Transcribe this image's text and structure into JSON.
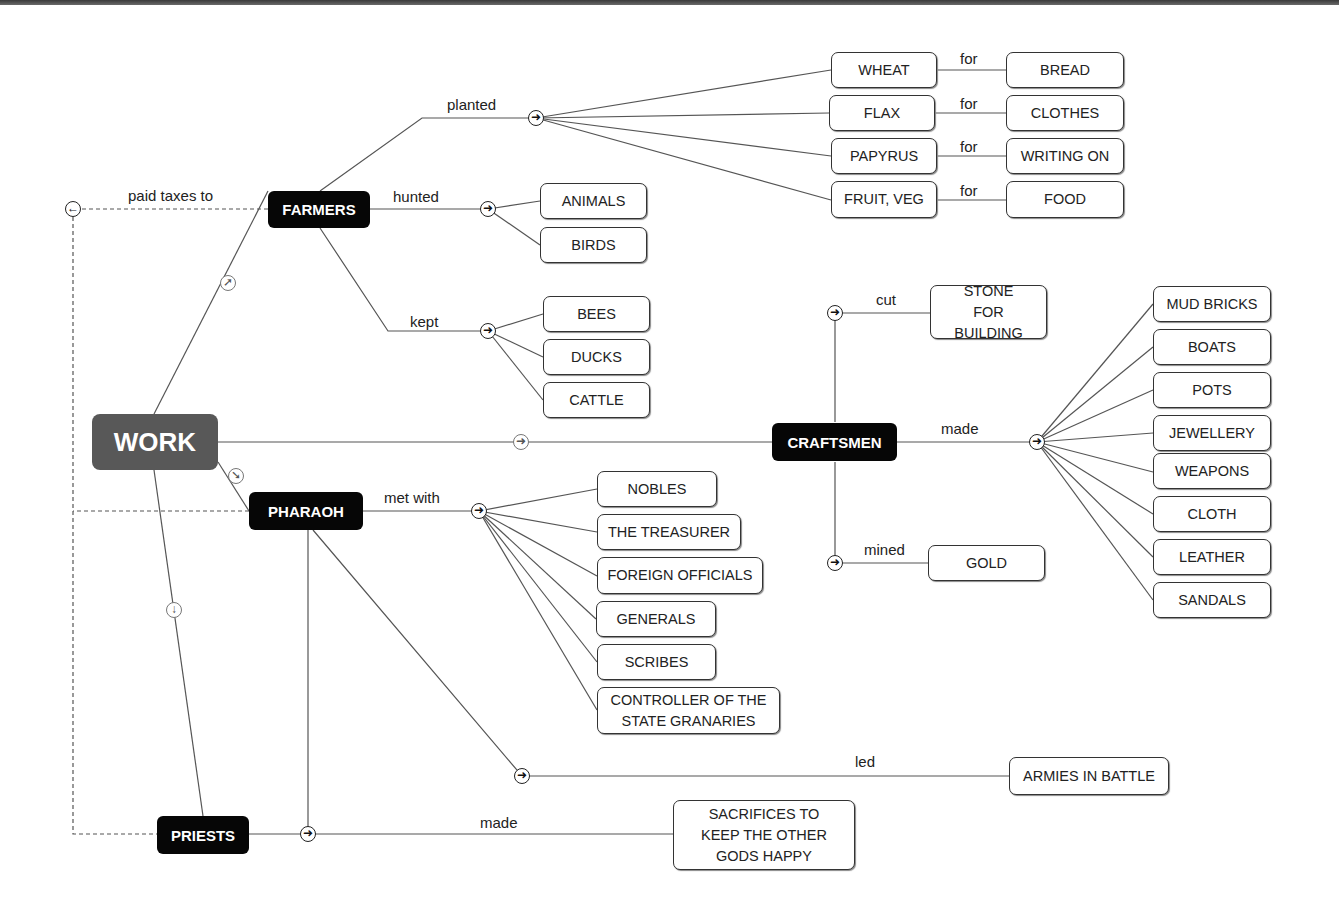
{
  "diagram": {
    "root": {
      "label": "WORK"
    },
    "groups": {
      "farmers": {
        "label": "FARMERS",
        "relations": {
          "paid_taxes_to": "paid taxes to",
          "planted": "planted",
          "hunted": "hunted",
          "kept": "kept",
          "for": "for"
        },
        "planted": [
          {
            "crop": "WHEAT",
            "use": "BREAD"
          },
          {
            "crop": "FLAX",
            "use": "CLOTHES"
          },
          {
            "crop": "PAPYRUS",
            "use": "WRITING ON"
          },
          {
            "crop": "FRUIT, VEG",
            "use": "FOOD"
          }
        ],
        "hunted": [
          "ANIMALS",
          "BIRDS"
        ],
        "kept": [
          "BEES",
          "DUCKS",
          "CATTLE"
        ]
      },
      "pharaoh": {
        "label": "PHARAOH",
        "relations": {
          "met_with": "met with",
          "led": "led"
        },
        "met_with": [
          "NOBLES",
          "THE TREASURER",
          "FOREIGN OFFICIALS",
          "GENERALS",
          "SCRIBES",
          "CONTROLLER OF THE STATE GRANARIES"
        ],
        "led": "ARMIES IN BATTLE"
      },
      "priests": {
        "label": "PRIESTS",
        "relations": {
          "made": "made"
        },
        "made": "SACRIFICES TO KEEP THE OTHER GODS HAPPY"
      },
      "craftsmen": {
        "label": "CRAFTSMEN",
        "relations": {
          "cut": "cut",
          "made": "made",
          "mined": "mined"
        },
        "cut": "STONE FOR BUILDING",
        "mined": "GOLD",
        "made": [
          "MUD BRICKS",
          "BOATS",
          "POTS",
          "JEWELLERY",
          "WEAPONS",
          "CLOTH",
          "LEATHER",
          "SANDALS"
        ]
      }
    },
    "icons": {
      "connector_right": "➜",
      "connector_left": "←",
      "connector_up_right": "➚",
      "connector_down_right": "➘",
      "connector_down": "↓"
    },
    "colors": {
      "root": "#585858",
      "main": "#060606",
      "line": "#555555"
    }
  }
}
